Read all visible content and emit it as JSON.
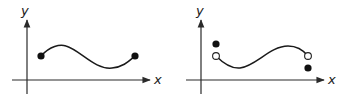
{
  "diagrams": [
    {
      "id": "left",
      "axis_labels": {
        "x": "x",
        "y": "y"
      },
      "description": "Continuous curve on a closed interval with filled endpoints",
      "endpoints": [
        {
          "side": "left",
          "type": "filled"
        },
        {
          "side": "right",
          "type": "filled"
        }
      ]
    },
    {
      "id": "right",
      "axis_labels": {
        "x": "x",
        "y": "y"
      },
      "description": "Curve with open endpoints; function values at endpoints plotted separately as filled dots (left above, right below)",
      "endpoints": [
        {
          "side": "left",
          "type": "open",
          "separate_value": "above"
        },
        {
          "side": "right",
          "type": "open",
          "separate_value": "below"
        }
      ]
    }
  ],
  "colors": {
    "ink": "#1a1a1a",
    "background": "#ffffff"
  }
}
